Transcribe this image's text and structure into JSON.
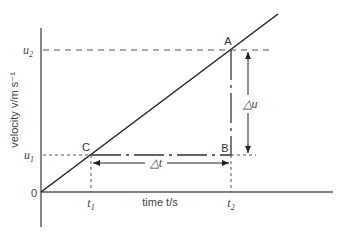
{
  "diagram": {
    "title": "",
    "y_axis_label": "velocity v/m s⁻¹",
    "x_axis_label": "time t/s",
    "origin_label": "0",
    "y_ticks": [
      {
        "label": "u",
        "sub": "2"
      },
      {
        "label": "u",
        "sub": "1"
      }
    ],
    "x_ticks": [
      {
        "label": "t",
        "sub": "1"
      },
      {
        "label": "t",
        "sub": "2"
      }
    ],
    "points": {
      "A": "A",
      "B": "B",
      "C": "C"
    },
    "delta_u": "△u",
    "delta_t": "△t",
    "colors": {
      "line": "#222222",
      "axis": "#555555",
      "dashed": "#555555"
    }
  }
}
